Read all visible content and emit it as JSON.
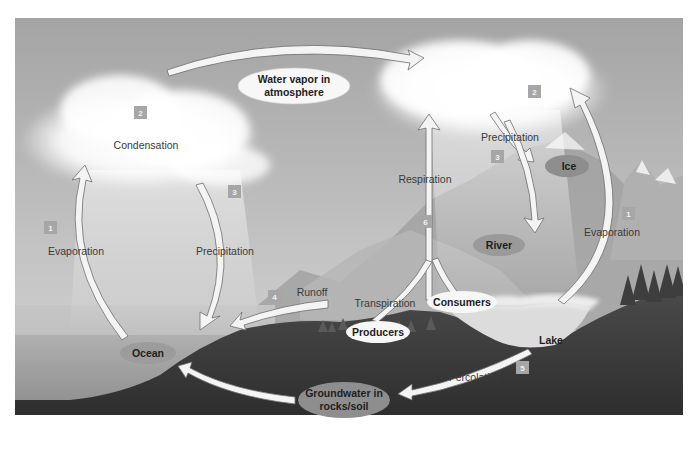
{
  "diagram": {
    "type": "water-cycle",
    "colors": {
      "sky_top": "#9a9a9a",
      "sky_bottom": "#c8c8c8",
      "cloud": "#ffffff",
      "ground": "#3c3c3c",
      "ocean": "#a8a8a8",
      "arrow_fill": "#f4f4f4",
      "arrow_stroke": "#6a6a6a",
      "badge": "#a6a6a6",
      "oval_dark": "#8e8e8e",
      "oval_light": "#f5f5f5"
    },
    "nodes": {
      "water_vapor": {
        "line1": "Water vapor in",
        "line2": "atmosphere"
      },
      "ocean": "Ocean",
      "ice": "Ice",
      "river": "River",
      "lake": "Lake",
      "producers": "Producers",
      "consumers": "Consumers",
      "groundwater": {
        "line1": "Groundwater in",
        "line2": "rocks/soil"
      }
    },
    "processes": [
      {
        "badge": "1",
        "label": "Evaporation",
        "side": "left"
      },
      {
        "badge": "2",
        "label": "Condensation",
        "side": "left"
      },
      {
        "badge": "3",
        "label": "Precipitation",
        "side": "left"
      },
      {
        "badge": "4",
        "label": "Runoff"
      },
      {
        "badge": "5",
        "label": "Percolation"
      },
      {
        "badge": "6",
        "label": "Respiration"
      },
      {
        "badge": "6",
        "label": "Transpiration"
      },
      {
        "badge": "1",
        "label": "Evaporation",
        "side": "right"
      },
      {
        "badge": "2",
        "label": "",
        "side": "right"
      },
      {
        "badge": "3",
        "label": "Precipitation",
        "side": "right"
      }
    ]
  }
}
